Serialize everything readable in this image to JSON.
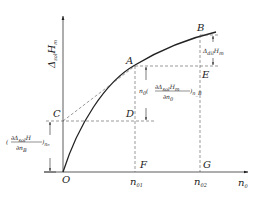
{
  "diagram": {
    "y_axis_label": "Δ_sol H_m",
    "x_axis_label": "n_0",
    "points": {
      "O": "O",
      "A": "A",
      "B": "B",
      "C": "C",
      "D": "D",
      "E": "E",
      "F": "F",
      "G": "G"
    },
    "x_ticks": [
      "n_01",
      "n_02"
    ],
    "annotations": {
      "slope_term": "n_0 (∂Δ_sol H_m / ∂n_0)_nB",
      "intercept_term": "(∂Δ_sol H / ∂n_B)_n0",
      "dil_term": "Δ_dil H_m"
    }
  }
}
